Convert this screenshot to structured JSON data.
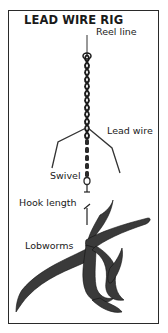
{
  "diagram": {
    "title": "LEAD WIRE RIG",
    "labels": {
      "reel_line": "Reel line",
      "lead_wire": "Lead wire",
      "swivel": "Swivel",
      "hook_length": "Hook length",
      "lobworms": "Lobworms"
    },
    "colors": {
      "ink": "#1a1a1a",
      "frame": "#2a2a2a",
      "background": "#ffffff"
    }
  }
}
